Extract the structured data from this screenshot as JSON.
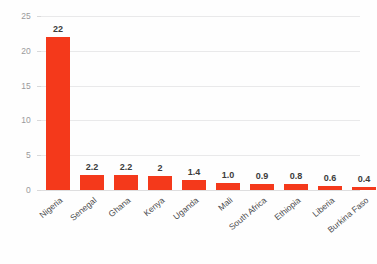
{
  "chart_data": {
    "type": "bar",
    "title": "",
    "subtitle": "",
    "xlabel": "",
    "ylabel": "",
    "categories": [
      "Nigeria",
      "Senegal",
      "Ghana",
      "Kenya",
      "Uganda",
      "Mali",
      "South Africa",
      "Ethiopia",
      "Liberia",
      "Burkina Faso"
    ],
    "values": [
      22,
      2.2,
      2.2,
      2,
      1.4,
      1.0,
      0.9,
      0.8,
      0.6,
      0.4
    ],
    "value_labels": [
      "22",
      "2.2",
      "2.2",
      "2",
      "1.4",
      "1.0",
      "0.9",
      "0.8",
      "0.6",
      "0.4"
    ],
    "ylim": [
      0,
      25
    ],
    "y_ticks": [
      0,
      5,
      10,
      15,
      20,
      25
    ],
    "y_tick_labels": [
      "0",
      "5",
      "10",
      "15",
      "20",
      "25"
    ],
    "grid": true,
    "grid_axis": "y",
    "legend": false,
    "legend_position": "none",
    "series": [
      {
        "name": "",
        "values": [
          22,
          2.2,
          2.2,
          2,
          1.4,
          1.0,
          0.9,
          0.8,
          0.6,
          0.4
        ]
      }
    ]
  },
  "colors": {
    "bar": "#f4391b",
    "background": "#fefefe",
    "gridline": "#e9e9ea",
    "baseline": "#dededf",
    "y_tick_text": "#9a9a9c",
    "x_label_text": "#4a4a4c",
    "value_label_text": "#3c3c3c"
  }
}
